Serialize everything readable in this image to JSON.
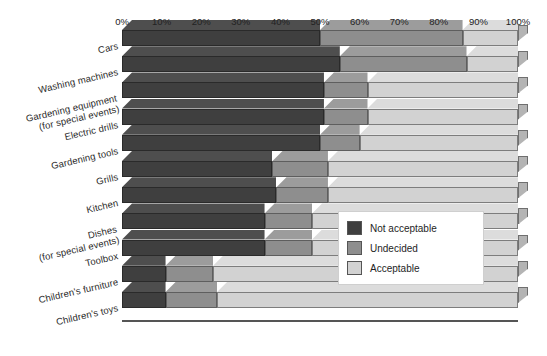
{
  "chart_data": {
    "type": "bar",
    "orientation": "horizontal",
    "stacked": true,
    "stack_mode": "percent",
    "style": "3d-stacked-horizontal-bar",
    "title": "",
    "subtitle": "",
    "xlabel": "",
    "ylabel": "",
    "xlim": [
      0,
      100
    ],
    "xunit": "%",
    "xticks": [
      0,
      10,
      20,
      30,
      40,
      50,
      60,
      70,
      80,
      90,
      100
    ],
    "xtick_labels": [
      "0%",
      "10%",
      "20%",
      "30%",
      "40%",
      "50%",
      "60%",
      "70%",
      "80%",
      "90%",
      "100%"
    ],
    "grid": false,
    "legend_position": "inside-right-middle",
    "categories": [
      "Cars",
      "Washing machines",
      "Gardening equipment (for special events)",
      "Electric drills",
      "Gardening tools",
      "Grills",
      "Kitchen",
      "Dishes (for special events)",
      "Toolbox",
      "Children's furniture",
      "Children's toys"
    ],
    "category_labels": [
      {
        "line1": "Cars",
        "line2": ""
      },
      {
        "line1": "Washing machines",
        "line2": ""
      },
      {
        "line1": "Gardening equipment",
        "line2": "(for special events)"
      },
      {
        "line1": "Electric drills",
        "line2": ""
      },
      {
        "line1": "Gardening tools",
        "line2": ""
      },
      {
        "line1": "Grills",
        "line2": ""
      },
      {
        "line1": "Kitchen",
        "line2": ""
      },
      {
        "line1": "Dishes",
        "line2": "(for special events)"
      },
      {
        "line1": "Toolbox",
        "line2": ""
      },
      {
        "line1": "Children's furniture",
        "line2": ""
      },
      {
        "line1": "Children's toys",
        "line2": ""
      }
    ],
    "series": [
      {
        "name": "Not acceptable",
        "color": "#3f3f3f",
        "values": [
          50,
          55,
          51,
          51,
          50,
          38,
          39,
          36,
          36,
          11,
          11
        ]
      },
      {
        "name": "Undecided",
        "color": "#8e8e8e",
        "values": [
          36,
          32,
          11,
          11,
          10,
          14,
          13,
          12,
          12,
          12,
          13
        ]
      },
      {
        "name": "Acceptable",
        "color": "#d2d2d2",
        "values": [
          14,
          13,
          38,
          38,
          40,
          48,
          48,
          52,
          52,
          77,
          76
        ]
      }
    ]
  },
  "legend": {
    "items": [
      {
        "label": "Not acceptable",
        "swatch": "na"
      },
      {
        "label": "Undecided",
        "swatch": "un"
      },
      {
        "label": "Acceptable",
        "swatch": "ac"
      }
    ]
  },
  "colors": {
    "not_acceptable": "#3f3f3f",
    "undecided": "#8e8e8e",
    "acceptable": "#d2d2d2",
    "axis": "#555555",
    "background": "#ffffff"
  }
}
